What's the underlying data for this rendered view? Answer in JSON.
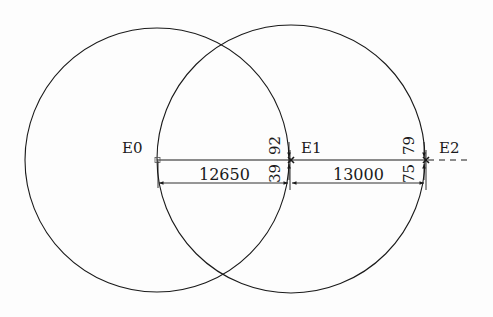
{
  "diagram": {
    "type": "geometric-construction",
    "colors": {
      "stroke": "#1a1a1a",
      "background": "#fdfdfd"
    },
    "points": [
      {
        "label": "E0",
        "x": 157,
        "y": 160
      },
      {
        "label": "E1",
        "x": 291,
        "y": 160
      },
      {
        "label": "E2",
        "x": 426,
        "y": 160
      }
    ],
    "circles": [
      {
        "name": "circle-centered-E0",
        "cx": 157,
        "cy": 160,
        "r": 132
      },
      {
        "name": "circle-centered-E1",
        "cx": 291,
        "cy": 159,
        "r": 134
      }
    ],
    "dimensions": [
      {
        "name": "dimension-e0-e1",
        "value": "12650"
      },
      {
        "name": "dimension-e1-e2",
        "value": "13000"
      }
    ],
    "offsets": [
      {
        "name": "offset-e1-upper",
        "value": "92"
      },
      {
        "name": "offset-e1-lower",
        "value": "39"
      },
      {
        "name": "offset-e2-upper",
        "value": "79"
      },
      {
        "name": "offset-e2-lower",
        "value": "75"
      }
    ]
  }
}
